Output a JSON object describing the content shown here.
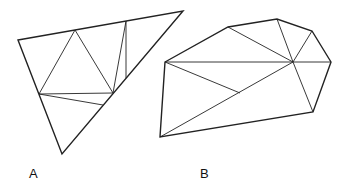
{
  "figures": [
    {
      "id": "A",
      "label": "A",
      "outline": [
        [
          18,
          40
        ],
        [
          183,
          11
        ],
        [
          62,
          154
        ]
      ],
      "edges": [
        [
          [
            75,
            30
          ],
          [
            39,
            94
          ]
        ],
        [
          [
            75,
            30
          ],
          [
            113,
            93
          ]
        ],
        [
          [
            126,
            21
          ],
          [
            113,
            93
          ]
        ],
        [
          [
            126,
            21
          ],
          [
            126,
            78
          ]
        ],
        [
          [
            39,
            94
          ],
          [
            113,
            93
          ]
        ],
        [
          [
            39,
            94
          ],
          [
            103,
            105
          ]
        ]
      ]
    },
    {
      "id": "B",
      "label": "B",
      "outline": [
        [
          165,
          62
        ],
        [
          228,
          27
        ],
        [
          277,
          19
        ],
        [
          312,
          31
        ],
        [
          331,
          62
        ],
        [
          313,
          112
        ],
        [
          160,
          137
        ]
      ],
      "edges": [
        [
          [
            165,
            62
          ],
          [
            293,
            62
          ]
        ],
        [
          [
            293,
            62
          ],
          [
            331,
            62
          ]
        ],
        [
          [
            228,
            27
          ],
          [
            293,
            62
          ]
        ],
        [
          [
            277,
            19
          ],
          [
            293,
            62
          ]
        ],
        [
          [
            312,
            31
          ],
          [
            293,
            62
          ]
        ],
        [
          [
            313,
            112
          ],
          [
            293,
            62
          ]
        ],
        [
          [
            160,
            137
          ],
          [
            293,
            62
          ]
        ],
        [
          [
            165,
            62
          ],
          [
            240,
            93
          ]
        ]
      ]
    }
  ],
  "style": {
    "stroke": "#222222",
    "outline_width": 1.4,
    "edge_width": 0.9
  }
}
